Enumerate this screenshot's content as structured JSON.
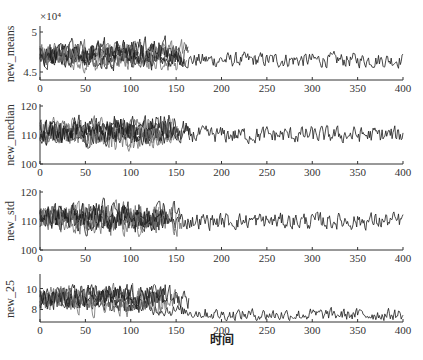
{
  "chart_data": [
    {
      "type": "line",
      "panel": 1,
      "ylabel": "new_means",
      "y_multiplier": "×10⁴",
      "ylim": [
        4.4,
        5.05
      ],
      "yticks": [
        4.5,
        5
      ],
      "xlim": [
        0,
        400
      ],
      "xticks": [
        0,
        50,
        100,
        150,
        200,
        250,
        300,
        350,
        400
      ],
      "series_note": "Multiple overlapping series (~7) over x=0–170; single series continues 170–400",
      "series": [
        {
          "name": "long_run",
          "x_range": [
            0,
            400
          ],
          "approx_level": 4.65,
          "noise": 0.08,
          "late_trend": [
            [
              170,
              4.62
            ],
            [
              250,
              4.66
            ],
            [
              330,
              4.7
            ],
            [
              360,
              4.72
            ],
            [
              400,
              4.6
            ]
          ]
        },
        {
          "name": "short_runs",
          "count": 6,
          "x_range": [
            0,
            170
          ],
          "approx_level": 4.72,
          "noise": 0.12
        }
      ]
    },
    {
      "type": "line",
      "panel": 2,
      "ylabel": "new_median",
      "ylim": [
        100,
        120
      ],
      "yticks": [
        100,
        110,
        120
      ],
      "xlim": [
        0,
        400
      ],
      "xticks": [
        0,
        50,
        100,
        150,
        200,
        250,
        300,
        350,
        400
      ],
      "series": [
        {
          "name": "long_run",
          "x_range": [
            0,
            400
          ],
          "approx_level": 110,
          "noise": 2.5
        },
        {
          "name": "short_runs",
          "count": 6,
          "x_range": [
            0,
            170
          ],
          "approx_level": 111,
          "noise": 3.5
        }
      ]
    },
    {
      "type": "line",
      "panel": 3,
      "ylabel": "new_std",
      "ylim": [
        100,
        120
      ],
      "yticks": [
        100,
        110,
        120
      ],
      "xlim": [
        0,
        400
      ],
      "xticks": [
        0,
        50,
        100,
        150,
        200,
        250,
        300,
        350,
        400
      ],
      "series": [
        {
          "name": "long_run",
          "x_range": [
            0,
            400
          ],
          "approx_level": 110,
          "noise": 2.5
        },
        {
          "name": "short_runs",
          "count": 6,
          "x_range": [
            0,
            170
          ],
          "approx_level": 111,
          "noise": 3.5
        }
      ]
    },
    {
      "type": "line",
      "panel": 4,
      "ylabel": "new_25",
      "ylim": [
        6.8,
        11.2
      ],
      "yticks": [
        8,
        10
      ],
      "xlim": [
        0,
        400
      ],
      "xticks": [
        0,
        50,
        100,
        150,
        200,
        250,
        300,
        350,
        400
      ],
      "xlabel": "时间",
      "series": [
        {
          "name": "long_run",
          "x_range": [
            0,
            400
          ],
          "approx_level_start": 9.0,
          "approx_level_end": 7.5,
          "noise": 0.5
        },
        {
          "name": "short_runs",
          "count": 6,
          "x_range": [
            0,
            170
          ],
          "approx_level": 9.0,
          "noise": 0.9
        }
      ]
    }
  ],
  "labels": {
    "multiplier": "×10⁴",
    "panel1_ylabel": "new_means",
    "panel2_ylabel": "new_median",
    "panel3_ylabel": "new_std",
    "panel4_ylabel": "new_25",
    "xlabel": "时间"
  },
  "colors": {
    "axis": "#333333",
    "dark_series": "#1a1a1a",
    "gray_series": "#6e6e6e"
  }
}
